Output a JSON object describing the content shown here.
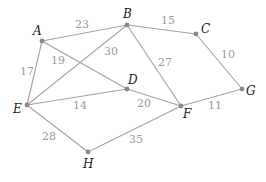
{
  "graph": {
    "nodes": [
      {
        "id": "A",
        "label": "A",
        "x": 42,
        "y": 41,
        "lx": 33,
        "ly": 35
      },
      {
        "id": "B",
        "label": "B",
        "x": 127,
        "y": 25,
        "lx": 123,
        "ly": 18
      },
      {
        "id": "C",
        "label": "C",
        "x": 196,
        "y": 34,
        "lx": 201,
        "ly": 33
      },
      {
        "id": "D",
        "label": "D",
        "x": 127,
        "y": 89,
        "lx": 128,
        "ly": 84
      },
      {
        "id": "E",
        "label": "E",
        "x": 27,
        "y": 105,
        "lx": 13,
        "ly": 113
      },
      {
        "id": "F",
        "label": "F",
        "x": 181,
        "y": 106,
        "lx": 183,
        "ly": 118
      },
      {
        "id": "G",
        "label": "G",
        "x": 242,
        "y": 89,
        "lx": 246,
        "ly": 95
      },
      {
        "id": "H",
        "label": "H",
        "x": 88,
        "y": 152,
        "lx": 83,
        "ly": 168
      }
    ],
    "edges": [
      {
        "from": "A",
        "to": "B",
        "weight": "23",
        "wx": 75,
        "wy": 28
      },
      {
        "from": "B",
        "to": "C",
        "weight": "15",
        "wx": 161,
        "wy": 24
      },
      {
        "from": "C",
        "to": "G",
        "weight": "10",
        "wx": 221,
        "wy": 58
      },
      {
        "from": "A",
        "to": "E",
        "weight": "17",
        "wx": 20,
        "wy": 75
      },
      {
        "from": "A",
        "to": "D",
        "weight": "19",
        "wx": 51,
        "wy": 64
      },
      {
        "from": "B",
        "to": "E",
        "weight": "30",
        "wx": 104,
        "wy": 55
      },
      {
        "from": "B",
        "to": "F",
        "weight": "27",
        "wx": 158,
        "wy": 66
      },
      {
        "from": "E",
        "to": "D",
        "weight": "14",
        "wx": 73,
        "wy": 109
      },
      {
        "from": "D",
        "to": "F",
        "weight": "20",
        "wx": 137,
        "wy": 107
      },
      {
        "from": "F",
        "to": "G",
        "weight": "11",
        "wx": 208,
        "wy": 109
      },
      {
        "from": "E",
        "to": "H",
        "weight": "28",
        "wx": 42,
        "wy": 140
      },
      {
        "from": "H",
        "to": "F",
        "weight": "35",
        "wx": 129,
        "wy": 143
      }
    ]
  },
  "colors": {
    "edge": "#a3a3a3",
    "node": "#8a8a8a",
    "node_label": "#222222",
    "weight_label": "#9a9a9a"
  }
}
